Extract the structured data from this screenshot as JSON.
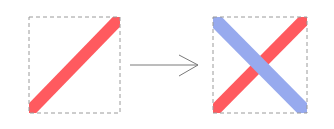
{
  "diagram": {
    "colors": {
      "background": "#ffffff",
      "box_border": "#9a9a9a",
      "red_bar": "#ff5a5f",
      "blue_bar": "#97aaee",
      "arrow": "#7a7a7a"
    },
    "panels": [
      {
        "id": "before",
        "box": {
          "x": 29,
          "y": 17,
          "width": 91,
          "height": 96
        },
        "bars": [
          {
            "color": "red",
            "direction": "bottom-left-to-top-right",
            "x1": 34,
            "y1": 106,
            "x2": 116,
            "y2": 23
          }
        ]
      },
      {
        "id": "after",
        "box": {
          "x": 213,
          "y": 17,
          "width": 94,
          "height": 96
        },
        "bars": [
          {
            "color": "red",
            "direction": "bottom-left-to-top-right",
            "x1": 220,
            "y1": 106,
            "x2": 302,
            "y2": 23
          },
          {
            "color": "blue",
            "direction": "top-left-to-bottom-right",
            "x1": 220,
            "y1": 24,
            "x2": 302,
            "y2": 106
          }
        ]
      }
    ],
    "arrow": {
      "x1": 130,
      "y1": 65,
      "x2": 198,
      "y2": 65,
      "direction": "right"
    }
  }
}
